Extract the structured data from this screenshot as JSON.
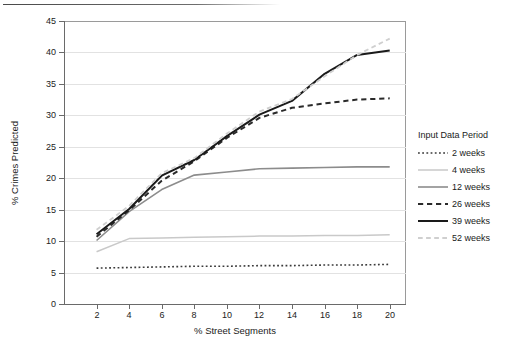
{
  "chart_data": {
    "type": "line",
    "title": "",
    "xlabel": "% Street Segments",
    "ylabel": "% Crimes Predicted",
    "xlim": [
      0,
      21
    ],
    "ylim": [
      0,
      45
    ],
    "xticks": [
      2,
      4,
      6,
      8,
      10,
      12,
      14,
      16,
      18,
      20
    ],
    "yticks": [
      0,
      5,
      10,
      15,
      20,
      25,
      30,
      35,
      40,
      45
    ],
    "grid": true,
    "legend_title": "Input Data Period",
    "legend_position": "right",
    "x": [
      2,
      4,
      6,
      8,
      10,
      12,
      14,
      16,
      18,
      20
    ],
    "series": [
      {
        "name": "2 weeks",
        "values": [
          5.7,
          5.8,
          5.9,
          6.0,
          6.0,
          6.1,
          6.1,
          6.2,
          6.2,
          6.3
        ],
        "style": "dotted",
        "color": "#3a3a3a",
        "width": 1.6
      },
      {
        "name": "4 weeks",
        "values": [
          8.3,
          10.4,
          10.5,
          10.6,
          10.7,
          10.8,
          10.8,
          10.9,
          10.9,
          11.0
        ],
        "style": "solid",
        "color": "#c9c9c9",
        "width": 1.5
      },
      {
        "name": "12 weeks",
        "values": [
          10.1,
          14.7,
          18.2,
          20.5,
          21.0,
          21.5,
          21.6,
          21.7,
          21.8,
          21.8
        ],
        "style": "solid",
        "color": "#8c8c8c",
        "width": 1.6
      },
      {
        "name": "26 weeks",
        "values": [
          10.7,
          14.9,
          19.6,
          22.7,
          26.4,
          29.6,
          31.2,
          31.9,
          32.5,
          32.7
        ],
        "style": "dashed",
        "color": "#2a2a2a",
        "width": 2.0
      },
      {
        "name": "39 weeks",
        "values": [
          11.1,
          15.1,
          20.4,
          22.9,
          26.7,
          30.1,
          32.3,
          36.6,
          39.6,
          40.3
        ],
        "style": "solid",
        "color": "#1a1a1a",
        "width": 2.0
      },
      {
        "name": "52 weeks",
        "values": [
          11.8,
          15.6,
          20.8,
          23.2,
          27.1,
          30.6,
          32.6,
          36.2,
          39.6,
          42.2
        ],
        "style": "dashed",
        "color": "#cfcfcf",
        "width": 1.8
      }
    ]
  },
  "legend": {
    "title": "Input Data Period",
    "items": [
      {
        "label": "2 weeks"
      },
      {
        "label": "4 weeks"
      },
      {
        "label": "12 weeks"
      },
      {
        "label": "26 weeks"
      },
      {
        "label": "39 weeks"
      },
      {
        "label": "52 weeks"
      }
    ]
  },
  "axes": {
    "y_title": "% Crimes Predicted",
    "x_title": "% Street Segments",
    "y_tick_labels": [
      "45",
      "40",
      "35",
      "30",
      "25",
      "20",
      "15",
      "10",
      "5",
      "0"
    ],
    "x_tick_labels": [
      "2",
      "4",
      "6",
      "8",
      "10",
      "12",
      "14",
      "16",
      "18",
      "20"
    ]
  },
  "colors": {
    "grid": "#e2e2e2",
    "axis": "#6a6a6a",
    "frame": "#9a9a9a",
    "text": "#1a1a1a"
  }
}
